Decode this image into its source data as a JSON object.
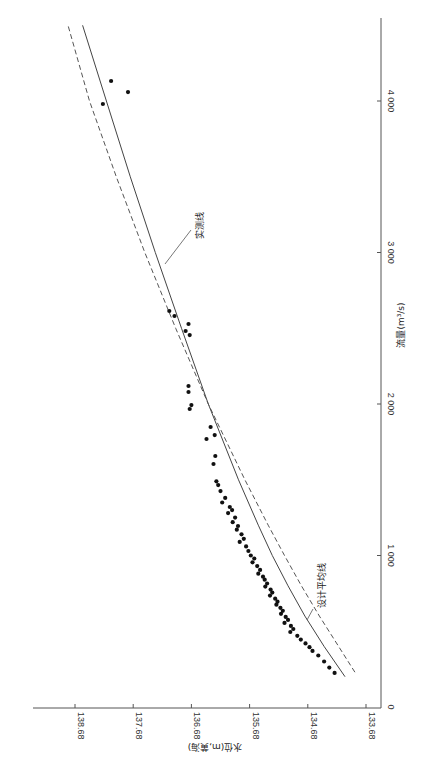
{
  "chart_data": {
    "type": "scatter",
    "title": "",
    "orientation": "rotated-90-clockwise",
    "xlabel": "流量(m³/s)",
    "ylabel": "水位(m,黄海)",
    "x_axis": {
      "label": "流量(m³/s)",
      "range": [
        0,
        4500
      ],
      "ticks": [
        0,
        1000,
        2000,
        3000,
        4000
      ],
      "tick_labels": [
        "0",
        "1 000",
        "2 000",
        "3 000",
        "4 000"
      ]
    },
    "y_axis": {
      "label": "水位(m,黄海)",
      "range": [
        133.4,
        139.4
      ],
      "ticks": [
        133.68,
        134.68,
        135.68,
        136.68,
        137.68,
        138.68
      ],
      "tick_labels": [
        "133.68",
        "134.68",
        "135.68",
        "136.68",
        "137.68",
        "138.68"
      ]
    },
    "grid": false,
    "legend": null,
    "series": [
      {
        "name": "实测线",
        "kind": "line",
        "style": "solid",
        "points": [
          [
            200,
            134.04
          ],
          [
            400,
            134.4
          ],
          [
            600,
            134.73
          ],
          [
            800,
            135.02
          ],
          [
            1000,
            135.29
          ],
          [
            1200,
            135.53
          ],
          [
            1500,
            135.87
          ],
          [
            2000,
            136.39
          ],
          [
            2500,
            136.85
          ],
          [
            3000,
            137.3
          ],
          [
            3500,
            137.73
          ],
          [
            4000,
            138.14
          ],
          [
            4500,
            138.55
          ]
        ]
      },
      {
        "name": "设计平均线",
        "kind": "line",
        "style": "dashed",
        "points": [
          [
            230,
            133.87
          ],
          [
            400,
            134.15
          ],
          [
            600,
            134.48
          ],
          [
            800,
            134.79
          ],
          [
            1000,
            135.08
          ],
          [
            1200,
            135.36
          ],
          [
            1500,
            135.76
          ],
          [
            2000,
            136.39
          ],
          [
            2500,
            136.95
          ],
          [
            3000,
            137.48
          ],
          [
            3500,
            137.97
          ],
          [
            4000,
            138.43
          ],
          [
            4500,
            138.8
          ]
        ]
      },
      {
        "name": "实测点",
        "kind": "scatter",
        "points": [
          [
            4132,
            138.06
          ],
          [
            4059,
            137.77
          ],
          [
            3980,
            138.2
          ],
          [
            2614,
            137.06
          ],
          [
            2581,
            136.97
          ],
          [
            2528,
            136.73
          ],
          [
            2482,
            136.78
          ],
          [
            2455,
            136.71
          ],
          [
            2119,
            136.73
          ],
          [
            2079,
            136.73
          ],
          [
            1993,
            136.68
          ],
          [
            1967,
            136.71
          ],
          [
            1848,
            136.35
          ],
          [
            1795,
            136.28
          ],
          [
            1769,
            136.42
          ],
          [
            1657,
            136.27
          ],
          [
            1604,
            136.3
          ],
          [
            1490,
            136.25
          ],
          [
            1465,
            136.22
          ],
          [
            1425,
            136.18
          ],
          [
            1380,
            136.1
          ],
          [
            1350,
            136.15
          ],
          [
            1320,
            136.02
          ],
          [
            1300,
            135.98
          ],
          [
            1280,
            136.05
          ],
          [
            1250,
            135.93
          ],
          [
            1220,
            135.97
          ],
          [
            1195,
            135.88
          ],
          [
            1170,
            135.9
          ],
          [
            1140,
            135.82
          ],
          [
            1110,
            135.78
          ],
          [
            1090,
            135.85
          ],
          [
            1060,
            135.74
          ],
          [
            1030,
            135.7
          ],
          [
            1000,
            135.66
          ],
          [
            980,
            135.6
          ],
          [
            955,
            135.63
          ],
          [
            930,
            135.55
          ],
          [
            905,
            135.5
          ],
          [
            880,
            135.53
          ],
          [
            860,
            135.45
          ],
          [
            840,
            135.42
          ],
          [
            815,
            135.38
          ],
          [
            795,
            135.41
          ],
          [
            775,
            135.32
          ],
          [
            755,
            135.29
          ],
          [
            735,
            135.33
          ],
          [
            715,
            135.24
          ],
          [
            695,
            135.2
          ],
          [
            675,
            135.22
          ],
          [
            655,
            135.15
          ],
          [
            635,
            135.11
          ],
          [
            615,
            135.14
          ],
          [
            595,
            135.06
          ],
          [
            575,
            135.02
          ],
          [
            555,
            135.08
          ],
          [
            535,
            134.97
          ],
          [
            515,
            134.93
          ],
          [
            495,
            134.98
          ],
          [
            470,
            134.86
          ],
          [
            445,
            134.8
          ],
          [
            420,
            134.72
          ],
          [
            395,
            134.65
          ],
          [
            370,
            134.6
          ],
          [
            340,
            134.5
          ],
          [
            300,
            134.4
          ],
          [
            260,
            134.31
          ],
          [
            225,
            134.22
          ]
        ]
      }
    ],
    "annotations": [
      {
        "text": "实测线",
        "target_series": "实测线"
      },
      {
        "text": "设计平均线",
        "target_series": "设计平均线"
      }
    ]
  },
  "labels": {
    "axis_flow": "流量(m³/s)",
    "axis_level": "水位(m,黄海)",
    "annot_measured": "实测线",
    "annot_design": "设计平均线"
  }
}
